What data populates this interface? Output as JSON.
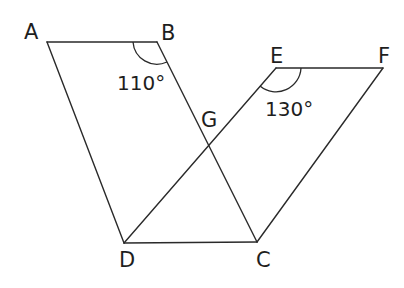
{
  "figure": {
    "points": {
      "A": {
        "label": "A",
        "x": 47,
        "y": 42
      },
      "B": {
        "label": "B",
        "x": 157,
        "y": 42
      },
      "C": {
        "label": "C",
        "x": 257,
        "y": 242
      },
      "D": {
        "label": "D",
        "x": 124,
        "y": 243
      },
      "E": {
        "label": "E",
        "x": 276,
        "y": 68
      },
      "F": {
        "label": "F",
        "x": 383,
        "y": 68
      },
      "G": {
        "label": "G",
        "x": 209,
        "y": 146
      }
    },
    "segments": [
      [
        "A",
        "B"
      ],
      [
        "A",
        "D"
      ],
      [
        "B",
        "C"
      ],
      [
        "E",
        "F"
      ],
      [
        "F",
        "C"
      ],
      [
        "E",
        "D"
      ],
      [
        "D",
        "C"
      ]
    ],
    "angles": {
      "B": {
        "vertex": "B",
        "value": "110°"
      },
      "E": {
        "vertex": "E",
        "value": "130°"
      }
    }
  }
}
